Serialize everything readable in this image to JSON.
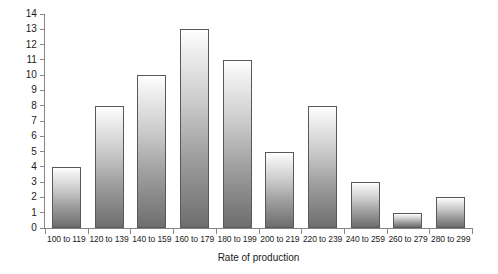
{
  "chart_data": {
    "type": "bar",
    "title": "",
    "subtitle": "",
    "xlabel": "Rate of production",
    "ylabel": "",
    "categories": [
      "100 to 119",
      "120 to 139",
      "140 to 159",
      "160 to 179",
      "180 to 199",
      "200 to 219",
      "220 to 239",
      "240 to 259",
      "260 to 279",
      "280 to 299"
    ],
    "values": [
      4,
      8,
      10,
      13,
      11,
      5,
      8,
      3,
      1,
      2
    ],
    "ylim": [
      0,
      14
    ],
    "ytick_step": 1,
    "yticks": [
      14,
      13,
      12,
      11,
      10,
      9,
      8,
      7,
      6,
      5,
      4,
      3,
      2,
      1,
      0
    ],
    "grid": false,
    "legend": false,
    "legend_position": "none",
    "bar_gradient_top": "#ffffff",
    "bar_gradient_bottom": "#6e6e6e",
    "bar_outline_color": "#585858",
    "axis_color": "#868686",
    "text_color": "#1b1b1b",
    "background": "#ffffff"
  }
}
